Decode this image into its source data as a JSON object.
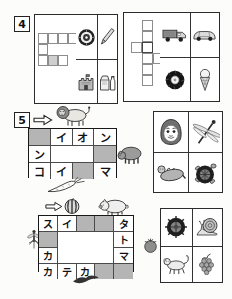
{
  "colors": {
    "paper": "#fcfcfa",
    "panel_border": "#2b2b2b",
    "grid_line": "#4a4a4a",
    "outline_grid_line": "#8d8d8d",
    "shaded_cell": "#b5b5b5",
    "ink": "#111111"
  },
  "panel4": {
    "number": "4",
    "outline_grid": {
      "rows": 3,
      "cols": 4,
      "present_cells": [
        "r1c1",
        "r1c2",
        "r1c3",
        "r1c4",
        "r2c1",
        "r3c1",
        "r3c2",
        "r3c3"
      ],
      "shaded_cells": [
        "r3c2"
      ]
    },
    "picture_cells": [
      "dartboard-icon",
      "pencil-icon",
      "castle-icon",
      "milk-carton-icon"
    ]
  },
  "panel4_answers": {
    "outline_grid": {
      "rows": 6,
      "cols": 4,
      "present_cells": [
        "r1c2",
        "r2c2",
        "r3c1",
        "r3c2",
        "r4c2",
        "r4c3",
        "r4c4",
        "r5c2",
        "r6c2"
      ],
      "bold_cells": [
        "r3c2"
      ]
    },
    "picture_cells": [
      "truck-icon",
      "car-icon",
      "tire-icon",
      "ice-cream-icon"
    ]
  },
  "panel5": {
    "number": "5",
    "grid": {
      "rows": 3,
      "cols": 4,
      "r1": {
        "c2": "イ",
        "c3": "オ",
        "c4": "ン"
      },
      "r2": {
        "c1": "ン"
      },
      "r3": {
        "c1": "コ",
        "c2": "イ",
        "c4": "マ"
      },
      "shaded_cells": [
        "r1c1",
        "r2c4",
        "r3c3"
      ],
      "open_white_area": "r2 c2-c3"
    },
    "pictures": [
      "arrow-icon",
      "lion-icon",
      "bear-icon",
      "daikon-icon"
    ]
  },
  "panel5_answers": {
    "picture_cells": [
      "daruma-icon",
      "dragonfly-icon",
      "sea-otter-icon",
      "turtle-icon"
    ]
  },
  "panel6": {
    "grid": {
      "rows": 4,
      "cols": 5,
      "r1": {
        "c1": "ス",
        "c2": "イ",
        "c5": "タ"
      },
      "r2": {
        "c5": "ト"
      },
      "r3": {
        "c1": "カ",
        "c5": "マ"
      },
      "r4": {
        "c1": "カ",
        "c2": "テ",
        "c3": "カ"
      },
      "shaded_cells": [
        "r1c3",
        "r1c4",
        "r2c1",
        "r4c4",
        "r4c5"
      ],
      "open_white_area": "r2-r3 c2-c4"
    },
    "pictures": [
      "arrow-icon",
      "watermelon-icon",
      "pig-icon",
      "mosquito-icon",
      "tomato-icon",
      "bird-icon"
    ]
  },
  "panel6_answers": {
    "picture_cells": [
      "turtle-top-icon",
      "snail-icon",
      "monkey-icon",
      "grapes-icon"
    ]
  }
}
